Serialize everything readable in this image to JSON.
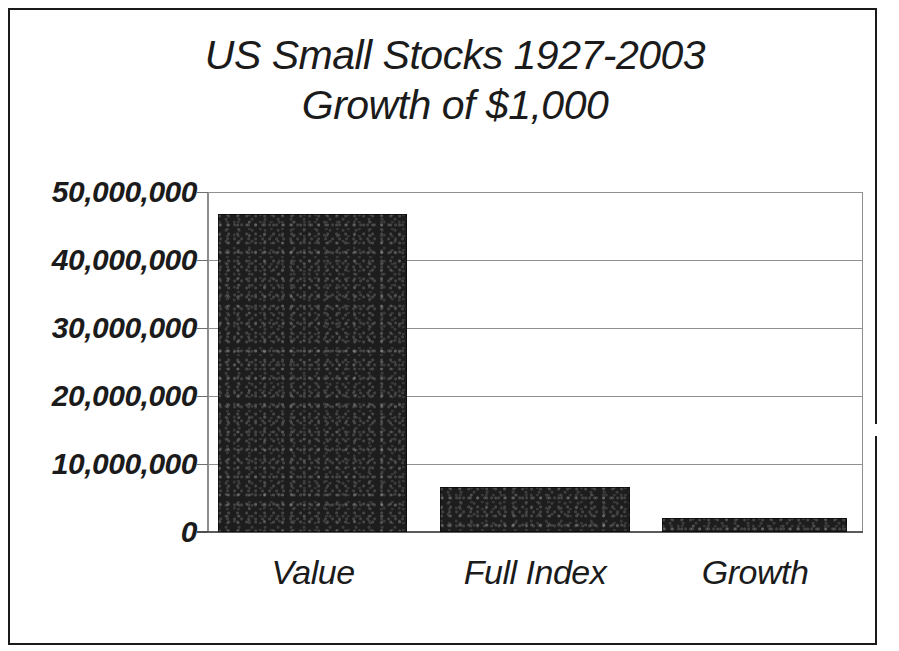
{
  "chart_data": {
    "type": "bar",
    "title": "US Small Stocks 1927-2003 Growth of $1,000",
    "title_lines": [
      "US Small Stocks 1927-2003",
      "Growth of $1,000"
    ],
    "xlabel": "",
    "ylabel": "",
    "categories": [
      "Value",
      "Full Index",
      "Growth"
    ],
    "values": [
      46800000,
      6600000,
      2050000
    ],
    "ylim": [
      0,
      50000000
    ],
    "ytick_values": [
      50000000,
      40000000,
      30000000,
      20000000,
      10000000,
      0
    ],
    "ytick_labels": [
      "50,000,000",
      "40,000,000",
      "30,000,000",
      "20,000,000",
      "10,000,000",
      "0"
    ],
    "grid": true,
    "legend": false,
    "legend_position": "none",
    "series": [
      {
        "name": "Growth of $1,000",
        "values": [
          46800000,
          6600000,
          2050000
        ]
      }
    ],
    "colors": {
      "bar": "#1d1d1d",
      "gridline": "#8f8f8f",
      "axis": "#5a5a5a",
      "text": "#1b1b1b",
      "background": "#ffffff",
      "page_border": "#1a1a1a"
    }
  }
}
